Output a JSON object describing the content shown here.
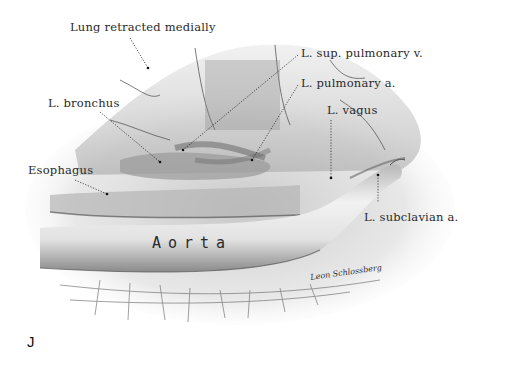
{
  "figure": {
    "panel_letter": "J",
    "style": "grayscale pencil anatomical illustration",
    "signature": "Leon Schlossberg",
    "colors": {
      "background": "#ffffff",
      "ink": "#2a2a2a",
      "shading_dark": "#6a6a6a",
      "shading_light": "#d8d8d8"
    }
  },
  "labels": {
    "lung": "Lung retracted medially",
    "sup_pulmonary_vein": "L. sup. pulmonary v.",
    "pulmonary_artery": "L. pulmonary a.",
    "bronchus": "L. bronchus",
    "vagus": "L. vagus",
    "esophagus": "Esophagus",
    "subclavian": "L. subclavian a.",
    "aorta": "Aorta"
  }
}
